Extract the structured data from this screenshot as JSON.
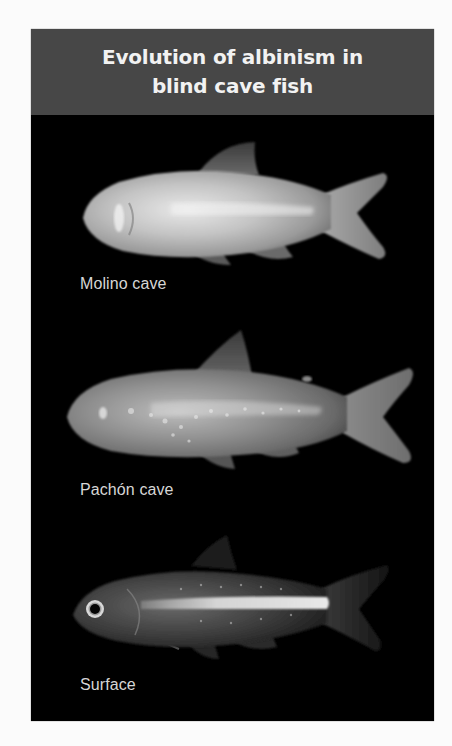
{
  "figure": {
    "title_lines": [
      "Evolution of albinism in",
      "blind cave fish"
    ],
    "colors": {
      "header_bg": "#474747",
      "header_text": "#f2f2f2",
      "panel_bg": "#000000",
      "label_text": "#d6d6d6",
      "page_bg": "#fbfbfb"
    },
    "specimens": [
      {
        "label": "Molino cave",
        "pigmentation": "albino",
        "eyes": "absent"
      },
      {
        "label": "Pachón cave",
        "pigmentation": "albino",
        "eyes": "absent"
      },
      {
        "label": "Surface",
        "pigmentation": "pigmented",
        "eyes": "present"
      }
    ]
  }
}
